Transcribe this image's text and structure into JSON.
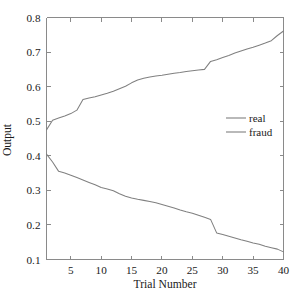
{
  "chart_data": {
    "type": "line",
    "title": "",
    "xlabel": "Trial Number",
    "ylabel": "Output",
    "xlim": [
      1,
      40
    ],
    "ylim": [
      0.1,
      0.8
    ],
    "grid": false,
    "legend_position": "center-right",
    "xticks": [
      5,
      10,
      15,
      20,
      25,
      30,
      35,
      40
    ],
    "xtick_labels": [
      "5",
      "10",
      "15",
      "20",
      "25",
      "30",
      "35",
      "40"
    ],
    "yticks": [
      0.1,
      0.2,
      0.3,
      0.4,
      0.5,
      0.6,
      0.7,
      0.8
    ],
    "ytick_labels": [
      "0.1",
      "0.2",
      "0.3",
      "0.4",
      "0.5",
      "0.6",
      "0.7",
      "0.8"
    ],
    "x": [
      1,
      2,
      3,
      4,
      5,
      6,
      7,
      8,
      9,
      10,
      11,
      12,
      13,
      14,
      15,
      16,
      17,
      18,
      19,
      20,
      21,
      22,
      23,
      24,
      25,
      26,
      27,
      28,
      29,
      30,
      31,
      32,
      33,
      34,
      35,
      36,
      37,
      38,
      39,
      40
    ],
    "series": [
      {
        "name": "real",
        "color": "#808080",
        "values": [
          0.475,
          0.503,
          0.509,
          0.515,
          0.522,
          0.532,
          0.563,
          0.567,
          0.571,
          0.576,
          0.581,
          0.587,
          0.594,
          0.601,
          0.611,
          0.619,
          0.624,
          0.628,
          0.631,
          0.633,
          0.636,
          0.639,
          0.641,
          0.644,
          0.646,
          0.648,
          0.65,
          0.673,
          0.678,
          0.684,
          0.69,
          0.697,
          0.703,
          0.709,
          0.714,
          0.72,
          0.726,
          0.733,
          0.748,
          0.761
        ]
      },
      {
        "name": "fraud",
        "color": "#808080",
        "values": [
          0.405,
          0.382,
          0.355,
          0.35,
          0.344,
          0.337,
          0.33,
          0.323,
          0.316,
          0.308,
          0.304,
          0.299,
          0.29,
          0.283,
          0.278,
          0.274,
          0.271,
          0.268,
          0.264,
          0.259,
          0.254,
          0.249,
          0.243,
          0.238,
          0.234,
          0.228,
          0.222,
          0.216,
          0.177,
          0.172,
          0.167,
          0.162,
          0.157,
          0.153,
          0.148,
          0.144,
          0.138,
          0.134,
          0.13,
          0.122
        ]
      }
    ],
    "legend_entries": [
      {
        "label": "real",
        "color": "#808080"
      },
      {
        "label": "fraud",
        "color": "#808080"
      }
    ]
  },
  "axes": {
    "axis_color": "#8a8a8a"
  }
}
